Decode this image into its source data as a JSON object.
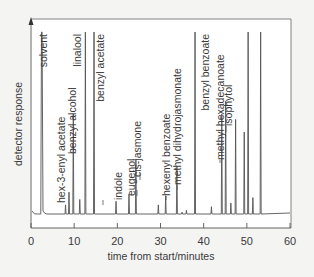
{
  "chart_data": {
    "type": "line",
    "title": "",
    "xlabel": "time from start/minutes",
    "ylabel": "detector response",
    "xlim": [
      0,
      60
    ],
    "x_ticks": [
      0,
      10,
      20,
      30,
      40,
      50,
      60
    ],
    "x_tick_labels": [
      "0",
      "10",
      "20",
      "30",
      "40",
      "50",
      "60"
    ],
    "grid": false,
    "legend": null,
    "baseline_note": "Gas chromatogram trace with labelled peaks (relative heights 0-1)",
    "peaks": [
      {
        "time": 2.5,
        "height": 1.0,
        "label": "solvent"
      },
      {
        "time": 8.0,
        "height": 0.05,
        "label": ""
      },
      {
        "time": 8.8,
        "height": 0.12,
        "label": "hex-3-enyl acetate"
      },
      {
        "time": 9.8,
        "height": 0.55,
        "label": "benzyl alcohol"
      },
      {
        "time": 11.3,
        "height": 0.08,
        "label": ""
      },
      {
        "time": 12.6,
        "height": 1.0,
        "label": "linalool"
      },
      {
        "time": 14.6,
        "height": 1.0,
        "label": "benzyl acetate"
      },
      {
        "time": 19.7,
        "height": 0.07,
        "label": "indole"
      },
      {
        "time": 22.7,
        "height": 0.11,
        "label": "eugenol"
      },
      {
        "time": 24.3,
        "height": 0.3,
        "label": "cis-jasmone"
      },
      {
        "time": 29.5,
        "height": 0.05,
        "label": ""
      },
      {
        "time": 31.2,
        "height": 0.1,
        "label": "hexenyl benzoate"
      },
      {
        "time": 33.8,
        "height": 0.26,
        "label": "methyl dihydrojasmonate"
      },
      {
        "time": 35.0,
        "height": 0.01,
        "label": ""
      },
      {
        "time": 36.0,
        "height": 0.02,
        "label": ""
      },
      {
        "time": 38.0,
        "height": 1.0,
        "label": "benzyl benzoate"
      },
      {
        "time": 41.8,
        "height": 0.04,
        "label": ""
      },
      {
        "time": 44.2,
        "height": 0.55,
        "label": "methyl hexadecanoate"
      },
      {
        "time": 45.1,
        "height": 0.62,
        "label": "isophytol"
      },
      {
        "time": 46.3,
        "height": 0.06,
        "label": ""
      },
      {
        "time": 47.4,
        "height": 0.52,
        "label": ""
      },
      {
        "time": 49.4,
        "height": 0.45,
        "label": ""
      },
      {
        "time": 50.3,
        "height": 1.0,
        "label": ""
      },
      {
        "time": 51.4,
        "height": 0.09,
        "label": ""
      },
      {
        "time": 53.2,
        "height": 1.0,
        "label": ""
      }
    ]
  },
  "labels": {
    "solvent": "solvent",
    "hex3enyl": "hex-3-enyl acetate",
    "benzyl_alcohol": "benzyl alcohol",
    "linalool": "linalool",
    "benzyl_acetate": "benzyl acetate",
    "indole": "indole",
    "eugenol": "eugenol",
    "cis_jasmone": "cis-jasmone",
    "hexenyl_benzoate": "hexenyl benzoate",
    "methyl_dihydrojasmonate": "methyl dihydrojasmonate",
    "benzyl_benzoate": "benzyl benzoate",
    "methyl_hexadecanoate": "methyl hexadecanoate",
    "isophytol": "isophytol"
  },
  "axes": {
    "xlabel": "time from start/minutes",
    "ylabel": "detector response",
    "ticks": [
      "0",
      "10",
      "20",
      "30",
      "40",
      "50",
      "60"
    ]
  },
  "colors": {
    "background": "#f4f4f3",
    "plot_bg": "#ffffff",
    "line": "#555555",
    "text": "#3a3a3a"
  }
}
